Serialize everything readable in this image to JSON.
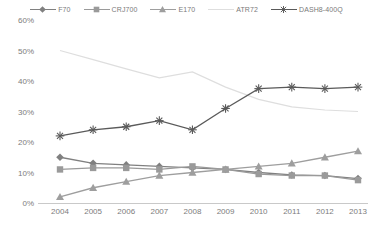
{
  "chart_data": {
    "type": "line",
    "title": "",
    "subtitle": "",
    "xlabel": "",
    "ylabel": "",
    "x": [
      2004,
      2005,
      2006,
      2007,
      2008,
      2009,
      2010,
      2011,
      2012,
      2013
    ],
    "categories": [
      "2004",
      "2005",
      "2006",
      "2007",
      "2008",
      "2009",
      "2010",
      "2011",
      "2012",
      "2013"
    ],
    "ylim": [
      0,
      60
    ],
    "ytick_values": [
      0,
      10,
      20,
      30,
      40,
      50,
      60
    ],
    "ytick_labels": [
      "0%",
      "10%",
      "20%",
      "30%",
      "40%",
      "50%",
      "60%"
    ],
    "yaxis_unit": "%",
    "grid": false,
    "legend_position": "top",
    "series": [
      {
        "name": "F70",
        "marker": "diamond",
        "color": "#808080",
        "values": [
          15.0,
          13.0,
          12.5,
          12.0,
          11.5,
          11.0,
          10.0,
          9.2,
          9.0,
          8.0
        ]
      },
      {
        "name": "CRJ700",
        "marker": "square",
        "color": "#9a9a9a",
        "values": [
          11.0,
          11.5,
          11.5,
          11.0,
          12.0,
          11.0,
          9.5,
          9.0,
          9.0,
          7.5
        ]
      },
      {
        "name": "E170",
        "marker": "triangle",
        "color": "#9e9e9e",
        "values": [
          2.0,
          5.0,
          7.0,
          9.0,
          10.0,
          11.0,
          12.0,
          13.0,
          15.0,
          17.0
        ]
      },
      {
        "name": "ATR72",
        "marker": "none",
        "color": "#dedede",
        "values": [
          50.0,
          47.0,
          44.0,
          41.0,
          43.0,
          38.0,
          34.0,
          31.5,
          30.5,
          30.0
        ]
      },
      {
        "name": "DASH8-400Q",
        "marker": "asterisk",
        "color": "#5a5a5a",
        "values": [
          22.0,
          24.0,
          25.0,
          27.0,
          24.0,
          31.0,
          37.5,
          38.0,
          37.5,
          38.0
        ]
      }
    ]
  }
}
